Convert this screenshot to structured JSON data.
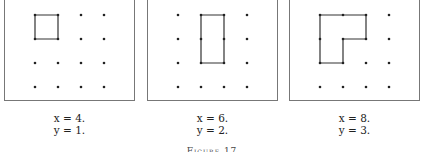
{
  "figure": {
    "caption": "Figure 17"
  },
  "panels": [
    {
      "id": "panel-1",
      "x_label": "x = 4.",
      "y_label": "y = 1.",
      "grid": {
        "cols": 4,
        "rows": 4
      },
      "polygon": [
        [
          0,
          0
        ],
        [
          1,
          0
        ],
        [
          1,
          1
        ],
        [
          0,
          1
        ]
      ],
      "boundary_points": 4,
      "interior_points": 1
    },
    {
      "id": "panel-2",
      "x_label": "x = 6.",
      "y_label": "y = 2.",
      "grid": {
        "cols": 4,
        "rows": 4
      },
      "polygon": [
        [
          1,
          0
        ],
        [
          2,
          0
        ],
        [
          2,
          1
        ],
        [
          2,
          2
        ],
        [
          1,
          2
        ],
        [
          1,
          1
        ]
      ],
      "boundary_points": 6,
      "interior_points": 2
    },
    {
      "id": "panel-3",
      "x_label": "x = 8.",
      "y_label": "y = 3.",
      "grid": {
        "cols": 4,
        "rows": 4
      },
      "polygon": [
        [
          0,
          0
        ],
        [
          1,
          0
        ],
        [
          2,
          0
        ],
        [
          2,
          1
        ],
        [
          1,
          1
        ],
        [
          1,
          2
        ],
        [
          0,
          2
        ],
        [
          0,
          1
        ]
      ],
      "boundary_points": 8,
      "interior_points": 3
    }
  ]
}
